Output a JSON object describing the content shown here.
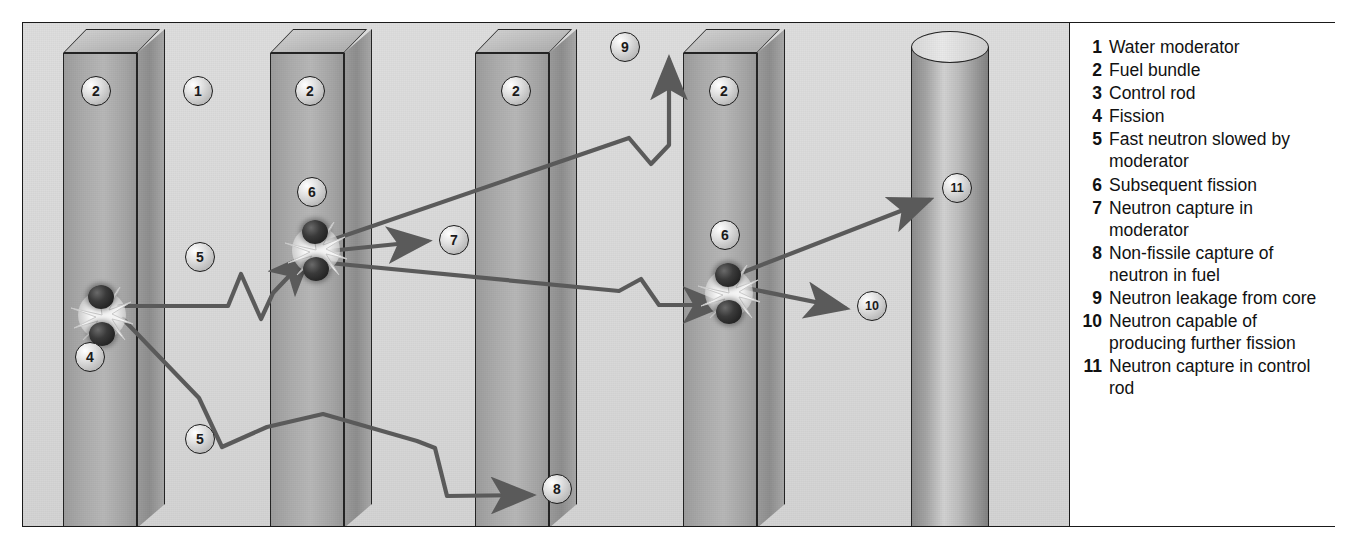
{
  "diagram": {
    "components": [
      {
        "id": "slab-1",
        "name": "fuel-bundle",
        "marker": "2",
        "x": 40,
        "width": 74,
        "depth": 28
      },
      {
        "id": "slab-2",
        "name": "fuel-bundle",
        "marker": "2",
        "x": 247,
        "width": 74,
        "depth": 28
      },
      {
        "id": "slab-3",
        "name": "fuel-bundle",
        "marker": "2",
        "x": 452,
        "width": 74,
        "depth": 28
      },
      {
        "id": "slab-4",
        "name": "fuel-bundle",
        "marker": "2",
        "x": 660,
        "width": 74,
        "depth": 28
      },
      {
        "id": "control-rod",
        "name": "control-rod",
        "marker": "11",
        "x": 888,
        "width": 78
      }
    ],
    "markers": [
      {
        "label": "1",
        "name": "marker-water-moderator",
        "x": 160,
        "y": 53
      },
      {
        "label": "2",
        "name": "marker-fuel-bundle-1",
        "x": 58,
        "y": 53
      },
      {
        "label": "2",
        "name": "marker-fuel-bundle-2",
        "x": 272,
        "y": 53
      },
      {
        "label": "2",
        "name": "marker-fuel-bundle-3",
        "x": 478,
        "y": 53
      },
      {
        "label": "2",
        "name": "marker-fuel-bundle-4",
        "x": 686,
        "y": 53
      },
      {
        "label": "4",
        "name": "marker-fission",
        "x": 52,
        "y": 319
      },
      {
        "label": "5",
        "name": "marker-fast-neutron-slowed-upper",
        "x": 162,
        "y": 219
      },
      {
        "label": "5",
        "name": "marker-fast-neutron-slowed-lower",
        "x": 162,
        "y": 401
      },
      {
        "label": "6",
        "name": "marker-subsequent-fission-1",
        "x": 274,
        "y": 154
      },
      {
        "label": "6",
        "name": "marker-subsequent-fission-2",
        "x": 687,
        "y": 197
      },
      {
        "label": "7",
        "name": "marker-neutron-capture-moderator",
        "x": 416,
        "y": 202
      },
      {
        "label": "8",
        "name": "marker-non-fissile-capture",
        "x": 519,
        "y": 451
      },
      {
        "label": "9",
        "name": "marker-neutron-leakage",
        "x": 587,
        "y": 9
      },
      {
        "label": "10",
        "name": "marker-neutron-further-fission",
        "x": 834,
        "y": 268
      },
      {
        "label": "11",
        "name": "marker-neutron-capture-control-rod",
        "x": 919,
        "y": 150
      }
    ],
    "fission_events": [
      {
        "name": "fission-burst-primary",
        "x": 42,
        "y": 255
      },
      {
        "name": "fission-burst-secondary-1",
        "x": 256,
        "y": 190
      },
      {
        "name": "fission-burst-secondary-2",
        "x": 669,
        "y": 233
      }
    ]
  },
  "legend": {
    "title": "Key",
    "items": [
      {
        "num": "1",
        "text": "Water moderator"
      },
      {
        "num": "2",
        "text": "Fuel bundle"
      },
      {
        "num": "3",
        "text": "Control rod"
      },
      {
        "num": "4",
        "text": "Fission"
      },
      {
        "num": "5",
        "text": "Fast neutron slowed by moderator"
      },
      {
        "num": "6",
        "text": "Subsequent fission"
      },
      {
        "num": "7",
        "text": "Neutron capture in moderator"
      },
      {
        "num": "8",
        "text": "Non-fissile capture of neutron in fuel"
      },
      {
        "num": "9",
        "text": "Neutron leakage from core"
      },
      {
        "num": "10",
        "text": "Neutron capable of producing further fission"
      },
      {
        "num": "11",
        "text": "Neutron capture in control rod"
      }
    ]
  },
  "colors": {
    "background": "#d9d9d9",
    "slab_face": "#b0b0b0",
    "outline": "#242424",
    "arrow": "#5a5a5a",
    "legend_background": "#ffffff",
    "text": "#111111"
  }
}
